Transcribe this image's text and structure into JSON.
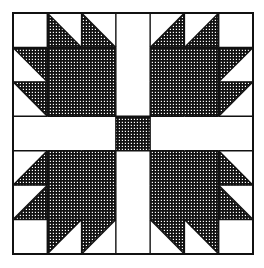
{
  "colors": {
    "background": "#ffffff",
    "line": "#111111",
    "hatch_ink": "#111111",
    "hatch_paper": "#ffffff"
  },
  "block": {
    "origin": [
      13,
      13
    ],
    "size": [
      240,
      241
    ],
    "grid_cells": 7,
    "sashing": {
      "vertical_cell": 3,
      "horizontal_cell": 3,
      "center_square_fill": "hatched"
    },
    "quadrants": [
      {
        "name": "top-left",
        "corner_white": [
          0,
          0
        ],
        "large_square": {
          "col": 1,
          "row": 1,
          "span": 2
        },
        "triangles": [
          {
            "col": 1,
            "row": 0,
            "diagonal": "tl-br",
            "hatched": "lower-left"
          },
          {
            "col": 2,
            "row": 0,
            "diagonal": "tl-br",
            "hatched": "lower-left"
          },
          {
            "col": 0,
            "row": 1,
            "diagonal": "tl-br",
            "hatched": "upper-right"
          },
          {
            "col": 0,
            "row": 2,
            "diagonal": "tl-br",
            "hatched": "upper-right"
          }
        ]
      },
      {
        "name": "top-right",
        "corner_white": [
          6,
          0
        ],
        "large_square": {
          "col": 4,
          "row": 1,
          "span": 2
        },
        "triangles": [
          {
            "col": 4,
            "row": 0,
            "diagonal": "bl-tr",
            "hatched": "lower-right"
          },
          {
            "col": 5,
            "row": 0,
            "diagonal": "bl-tr",
            "hatched": "lower-right"
          },
          {
            "col": 6,
            "row": 1,
            "diagonal": "bl-tr",
            "hatched": "upper-left"
          },
          {
            "col": 6,
            "row": 2,
            "diagonal": "bl-tr",
            "hatched": "upper-left"
          }
        ]
      },
      {
        "name": "bottom-left",
        "corner_white": [
          0,
          6
        ],
        "large_square": {
          "col": 1,
          "row": 4,
          "span": 2
        },
        "triangles": [
          {
            "col": 0,
            "row": 4,
            "diagonal": "bl-tr",
            "hatched": "lower-right"
          },
          {
            "col": 0,
            "row": 5,
            "diagonal": "bl-tr",
            "hatched": "lower-right"
          },
          {
            "col": 1,
            "row": 6,
            "diagonal": "bl-tr",
            "hatched": "upper-left"
          },
          {
            "col": 2,
            "row": 6,
            "diagonal": "bl-tr",
            "hatched": "upper-left"
          }
        ]
      },
      {
        "name": "bottom-right",
        "corner_white": [
          6,
          6
        ],
        "large_square": {
          "col": 4,
          "row": 4,
          "span": 2
        },
        "triangles": [
          {
            "col": 6,
            "row": 4,
            "diagonal": "tl-br",
            "hatched": "lower-left"
          },
          {
            "col": 6,
            "row": 5,
            "diagonal": "tl-br",
            "hatched": "lower-left"
          },
          {
            "col": 4,
            "row": 6,
            "diagonal": "tl-br",
            "hatched": "upper-right"
          },
          {
            "col": 5,
            "row": 6,
            "diagonal": "tl-br",
            "hatched": "upper-right"
          }
        ]
      }
    ]
  }
}
